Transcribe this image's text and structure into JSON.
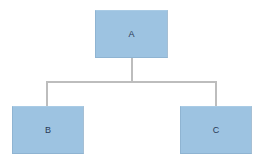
{
  "diagram": {
    "type": "org-chart",
    "colors": {
      "node_fill": "#9dc3e1",
      "node_text": "#2a3a55",
      "connector": "#bdbdbd",
      "background": "#ffffff"
    },
    "nodes": [
      {
        "id": "A",
        "label": "A",
        "level": 0
      },
      {
        "id": "B",
        "label": "B",
        "level": 1
      },
      {
        "id": "C",
        "label": "C",
        "level": 1
      }
    ],
    "edges": [
      {
        "from": "A",
        "to": "B"
      },
      {
        "from": "A",
        "to": "C"
      }
    ]
  }
}
